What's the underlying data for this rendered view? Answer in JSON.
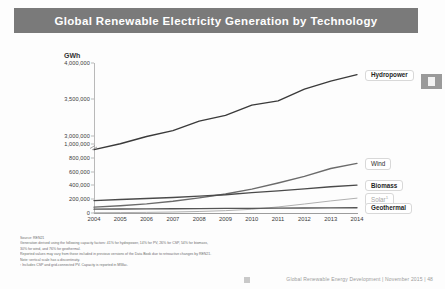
{
  "header": {
    "title": "Global Renewable Electricity Generation by Technology",
    "background": "#7a7a7a",
    "text_color": "#ffffff"
  },
  "rail": {
    "badge_label": ""
  },
  "chart_data": {
    "type": "line",
    "title": "Global Renewable Electricity Generation by Technology",
    "xlabel": "",
    "ylabel": "GWh",
    "unit_label": "GWh",
    "x": [
      2004,
      2005,
      2006,
      2007,
      2008,
      2009,
      2010,
      2011,
      2012,
      2013,
      2014
    ],
    "xtick_labels": [
      "2004",
      "2005",
      "2006",
      "2007",
      "2008",
      "2009",
      "2010",
      "2011",
      "2012",
      "2013",
      "2014"
    ],
    "ytick_labels": [
      "0",
      "200,000",
      "400,000",
      "600,000",
      "800,000",
      "1,000,000",
      "3,000,000",
      "3,500,000",
      "4,000,000"
    ],
    "ytick_values": [
      0,
      200000,
      400000,
      600000,
      800000,
      1000000,
      3000000,
      3500000,
      4000000
    ],
    "axis_break": {
      "present": true,
      "between": [
        1000000,
        3000000
      ]
    },
    "ylim": [
      0,
      4000000
    ],
    "grid": false,
    "legend_position": "right-callouts",
    "series": [
      {
        "name": "Hydropower",
        "color": "#3a3a3a",
        "emphasis": "strong",
        "values": [
          2810000,
          2890000,
          2990000,
          3070000,
          3200000,
          3280000,
          3420000,
          3480000,
          3640000,
          3750000,
          3840000
        ]
      },
      {
        "name": "Wind",
        "color": "#6b6b6b",
        "emphasis": "normal",
        "values": [
          85000,
          105000,
          133000,
          170000,
          220000,
          275000,
          345000,
          435000,
          530000,
          645000,
          720000
        ]
      },
      {
        "name": "Biomass",
        "color": "#4a4a4a",
        "emphasis": "strong",
        "values": [
          180000,
          195000,
          210000,
          225000,
          245000,
          265000,
          295000,
          320000,
          350000,
          380000,
          405000
        ]
      },
      {
        "name": "Solar",
        "footnote_marker": "1",
        "color": "#b0b0b0",
        "emphasis": "light",
        "values": [
          4000,
          6000,
          9000,
          14000,
          22000,
          34000,
          54000,
          88000,
          130000,
          175000,
          215000
        ]
      },
      {
        "name": "Geothermal",
        "color": "#555555",
        "emphasis": "strong",
        "values": [
          56000,
          58000,
          60000,
          62000,
          64000,
          66000,
          68000,
          70000,
          72000,
          74000,
          76000
        ]
      }
    ]
  },
  "notes": [
    "Source: REN21",
    "Generation derived using the following capacity factors: 41% for hydropower, 14% for PV, 26% for CSP, 54% for biomass,",
    "30% for wind, and 76% for geothermal.",
    "Reported values may vary from those included in previous versions of the Data Book due to retroactive changes by REN21.",
    "Note: vertical scale has a discontinuity.",
    "¹ Includes CSP and grid-connected PV. Capacity is reported in MWac."
  ],
  "footer": {
    "text": "Global Renewable Energy Development  |  November 2015  |  48"
  }
}
